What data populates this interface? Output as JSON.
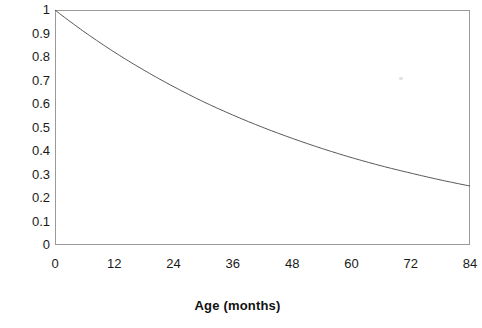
{
  "chart_data": {
    "type": "line",
    "title": "",
    "subtitle": "",
    "xlabel": "Age (months)",
    "ylabel": "",
    "xlim": [
      0,
      84
    ],
    "ylim": [
      0,
      1
    ],
    "grid": false,
    "legend": null,
    "x_ticks": [
      "0",
      "12",
      "24",
      "36",
      "48",
      "60",
      "72",
      "84"
    ],
    "x_tick_values": [
      0,
      12,
      24,
      36,
      48,
      60,
      72,
      84
    ],
    "y_ticks": [
      "1",
      "0.9",
      "0.8",
      "0.7",
      "0.6",
      "0.5",
      "0.4",
      "0.3",
      "0.2",
      "0.1",
      "0"
    ],
    "y_tick_values": [
      1,
      0.9,
      0.8,
      0.7,
      0.6,
      0.5,
      0.4,
      0.3,
      0.2,
      0.1,
      0
    ],
    "series": [
      {
        "name": "survival",
        "color": "#555555",
        "x": [
          0,
          6,
          12,
          18,
          24,
          30,
          36,
          42,
          48,
          54,
          60,
          66,
          72,
          78,
          84
        ],
        "values": [
          1.0,
          0.906,
          0.821,
          0.744,
          0.674,
          0.61,
          0.553,
          0.501,
          0.454,
          0.411,
          0.372,
          0.337,
          0.306,
          0.277,
          0.251
        ]
      }
    ],
    "annotations": []
  },
  "axis": {
    "x_title": "Age (months)"
  },
  "marks": {
    "speck_label": "scan-artifact"
  }
}
